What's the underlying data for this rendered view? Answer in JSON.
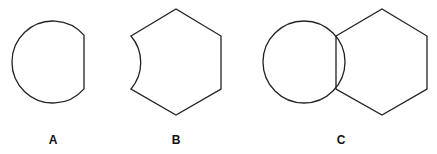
{
  "figure": {
    "stroke_color": "#222222",
    "shapes": [
      {
        "id": "A",
        "description": "circle with right side cut by a vertical chord"
      },
      {
        "id": "B",
        "description": "hexagon with concave circular arc cut on left side"
      },
      {
        "id": "C",
        "description": "circle overlapping hexagon sharing a vertical chord"
      }
    ],
    "labels": {
      "a": "A",
      "b": "B",
      "c": "C"
    }
  }
}
